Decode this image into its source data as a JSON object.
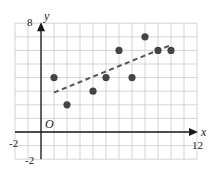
{
  "chart_data": {
    "type": "scatter",
    "title": "",
    "xlabel": "x",
    "ylabel": "y",
    "origin_label": "O",
    "xlim": [
      -2,
      12
    ],
    "ylim": [
      -2,
      8
    ],
    "grid": true,
    "x_tick_labels": [
      {
        "value": -2,
        "label": "-2"
      },
      {
        "value": 12,
        "label": "12"
      }
    ],
    "y_tick_labels": [
      {
        "value": 8,
        "label": "8"
      },
      {
        "value": -2,
        "label": "-2"
      }
    ],
    "series": [
      {
        "name": "data points",
        "points": [
          {
            "x": 1,
            "y": 4
          },
          {
            "x": 2,
            "y": 2
          },
          {
            "x": 4,
            "y": 3
          },
          {
            "x": 5,
            "y": 4
          },
          {
            "x": 6,
            "y": 6
          },
          {
            "x": 7,
            "y": 4
          },
          {
            "x": 8,
            "y": 7
          },
          {
            "x": 9,
            "y": 6
          },
          {
            "x": 10,
            "y": 6
          }
        ]
      }
    ],
    "trend_line": {
      "style": "dashed",
      "from": {
        "x": 1,
        "y": 2.9
      },
      "to": {
        "x": 10,
        "y": 6.4
      }
    },
    "colors": {
      "grid": "#c9c9c9",
      "axis": "#1a1a1a",
      "points": "#444444",
      "trend": "#555555"
    }
  }
}
